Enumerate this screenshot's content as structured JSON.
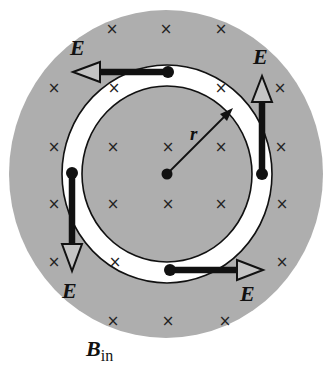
{
  "diagram": {
    "colors": {
      "field_region": "#aeaeae",
      "ring_fill": "#ffffff",
      "ink": "#111111",
      "arrow_head_fill": "#c4c4c4",
      "background": "#ffffff"
    },
    "field_region": {
      "cx": 166,
      "cy": 174,
      "rx": 157,
      "ry": 164
    },
    "ring": {
      "cx": 167,
      "cy": 174,
      "inner_rx": 85,
      "inner_ry": 88,
      "outer_rx": 105,
      "outer_ry": 109
    },
    "center_point": {
      "x": 167,
      "y": 174
    },
    "radius_label": "r",
    "field_label": {
      "main": "B",
      "subscript": "in"
    },
    "x_mark_glyph": "×",
    "x_marks": [
      [
        112,
        29
      ],
      [
        166,
        29
      ],
      [
        221,
        29
      ],
      [
        54,
        88
      ],
      [
        114,
        88
      ],
      [
        221,
        88
      ],
      [
        280,
        88
      ],
      [
        54,
        147
      ],
      [
        113,
        147
      ],
      [
        168,
        147
      ],
      [
        221,
        147
      ],
      [
        281,
        147
      ],
      [
        54,
        204
      ],
      [
        113,
        204
      ],
      [
        168,
        204
      ],
      [
        221,
        204
      ],
      [
        282,
        204
      ],
      [
        54,
        262
      ],
      [
        115,
        262
      ],
      [
        282,
        262
      ],
      [
        113,
        321
      ],
      [
        168,
        321
      ],
      [
        225,
        321
      ]
    ],
    "e_vectors": [
      {
        "name": "top",
        "label": "E",
        "direction": "left"
      },
      {
        "name": "right",
        "label": "E",
        "direction": "up"
      },
      {
        "name": "left",
        "label": "E",
        "direction": "down"
      },
      {
        "name": "bottom",
        "label": "E",
        "direction": "right"
      }
    ]
  }
}
